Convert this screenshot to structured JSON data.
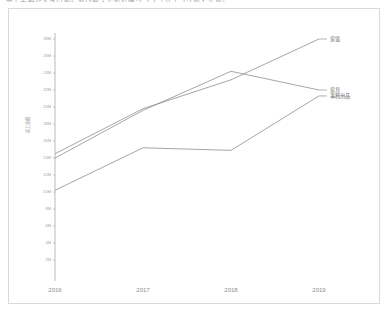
{
  "page": {
    "title": "売上金額が大きい順に並び替えた折れ線グラフ（カテゴリ別・年別）"
  },
  "chart_data": {
    "type": "line",
    "title": "",
    "xlabel": "",
    "ylabel": "売上金額",
    "x": [
      "2016",
      "2017",
      "2018",
      "2019"
    ],
    "categories": [
      "2016",
      "2017",
      "2018",
      "2019"
    ],
    "ylim": [
      0,
      29000000
    ],
    "ytick_labels": [
      "28M",
      "26M",
      "24M",
      "22M",
      "20M",
      "18M",
      "16M",
      "14M",
      "12M",
      "10M",
      "8M",
      "6M",
      "4M",
      "2M"
    ],
    "ytick_values": [
      28000000,
      26000000,
      24000000,
      22000000,
      20000000,
      18000000,
      16000000,
      14000000,
      12000000,
      10000000,
      8000000,
      6000000,
      4000000,
      2000000
    ],
    "grid": false,
    "legend_position": "right-of-line-end",
    "series": [
      {
        "name": "家電",
        "color": "#7f7f7f",
        "values": [
          14500000,
          19800000,
          23200000,
          28000000
        ]
      },
      {
        "name": "家具",
        "color": "#7f7f7f",
        "values": [
          14000000,
          19600000,
          24200000,
          22000000
        ]
      },
      {
        "name": "事務用品",
        "color": "#7f7f7f",
        "values": [
          10200000,
          15200000,
          14900000,
          21300000
        ]
      }
    ]
  },
  "axis": {
    "tick_color": "#a2a2a2",
    "line_color": "#8a8a8a"
  }
}
